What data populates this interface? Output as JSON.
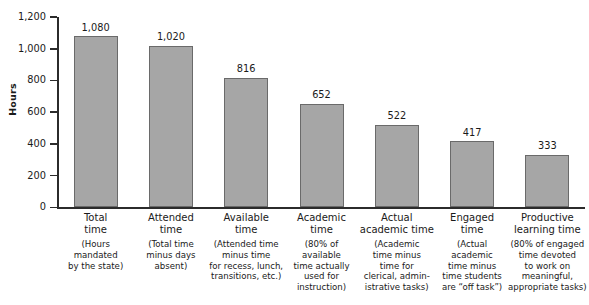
{
  "chart_data": {
    "type": "bar",
    "title": "",
    "xlabel": "",
    "ylabel": "Hours",
    "ylim": [
      0,
      1200
    ],
    "ytick_step": 200,
    "grid": false,
    "legend": "none",
    "bar_fill_color": "#a6a6a6",
    "bar_border_color": "#6a6a6a",
    "axis_color": "#2b2b2b",
    "background_color": "#ffffff",
    "categories": [
      "Total\ntime",
      "Attended\ntime",
      "Available\ntime",
      "Academic\ntime",
      "Actual\nacademic time",
      "Engaged\ntime",
      "Productive\nlearning time"
    ],
    "category_descriptions": [
      "(Hours\nmandated\nby the state)",
      "(Total time\nminus days\nabsent)",
      "(Attended time\nminus time\nfor recess, lunch,\ntransitions, etc.)",
      "(80% of\navailable\ntime actually\nused for\ninstruction)",
      "(Academic\ntime minus\ntime for\nclerical, admin-\nistrative tasks)",
      "(Actual\nacademic\ntime minus\ntime students\nare “off task”)",
      "(80% of engaged\ntime devoted\nto work on\nmeaningful,\nappropriate tasks)"
    ],
    "values": [
      1080,
      1020,
      816,
      652,
      522,
      417,
      333
    ],
    "value_labels": [
      "1,080",
      "1,020",
      "816",
      "652",
      "522",
      "417",
      "333"
    ],
    "ytick_labels": [
      "0",
      "200",
      "400",
      "600",
      "800",
      "1,000",
      "1,200"
    ],
    "ytick_values": [
      0,
      200,
      400,
      600,
      800,
      1000,
      1200
    ]
  }
}
